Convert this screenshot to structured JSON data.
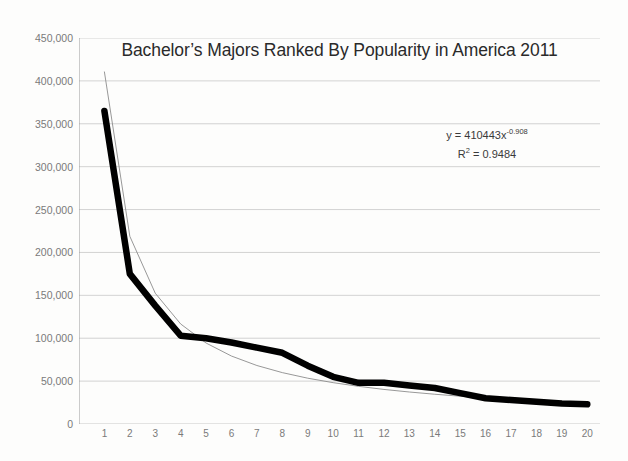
{
  "chart_data": {
    "type": "line",
    "title": "Bachelor’s Majors Ranked By Popularity in America 2011",
    "xlabel": "",
    "ylabel": "",
    "xlim": [
      0,
      20.5
    ],
    "ylim": [
      0,
      450000
    ],
    "grid": true,
    "legend": "none",
    "x": [
      1,
      2,
      3,
      4,
      5,
      6,
      7,
      8,
      9,
      10,
      11,
      12,
      13,
      14,
      15,
      16,
      17,
      18,
      19,
      20
    ],
    "xtick_labels": [
      "1",
      "2",
      "3",
      "4",
      "5",
      "6",
      "7",
      "8",
      "9",
      "10",
      "11",
      "12",
      "13",
      "14",
      "15",
      "16",
      "17",
      "18",
      "19",
      "20"
    ],
    "ytick_values": [
      0,
      50000,
      100000,
      150000,
      200000,
      250000,
      300000,
      350000,
      400000,
      450000
    ],
    "ytick_labels": [
      "0",
      "50,000",
      "100,000",
      "150,000",
      "200,000",
      "250,000",
      "300,000",
      "350,000",
      "400,000",
      "450,000"
    ],
    "series": [
      {
        "name": "Majors by popularity",
        "style": "thick-black-line",
        "color": "#000000",
        "values": [
          365000,
          175000,
          138000,
          103000,
          100000,
          95000,
          89000,
          83000,
          68000,
          55000,
          48000,
          48000,
          45000,
          42000,
          36000,
          30000,
          28000,
          26000,
          24000,
          23000
        ]
      },
      {
        "name": "Power trendline",
        "style": "thin-gray-line",
        "color": "#8c8c8c",
        "values": [
          410443,
          218800,
          152500,
          116600,
          94400,
          79200,
          68200,
          59900,
          53400,
          48200,
          43900,
          40300,
          37300,
          34700,
          32400,
          30500,
          28700,
          27100,
          25700,
          24400
        ]
      }
    ],
    "annotations": {
      "equation_prefix": "y = 410443x",
      "equation_exponent": "-0.908",
      "r_squared_prefix": "R",
      "r_squared_sup": "2",
      "r_squared_value": " = 0.9484"
    },
    "colors": {
      "data_line": "#000000",
      "trend_line": "#8c8c8c",
      "gridline": "#c8c8c8",
      "axis": "#9a9a9a",
      "tick_label": "#7a7a7a",
      "title": "#2a2a2a",
      "background": "#fdfdfc"
    }
  }
}
